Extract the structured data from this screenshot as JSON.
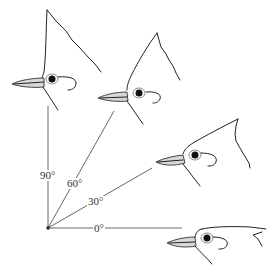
{
  "figure": {
    "type": "angle-diagram",
    "origin": {
      "x": 48,
      "y": 228
    },
    "angles": [
      {
        "label": "90°",
        "degrees": 90
      },
      {
        "label": "60°",
        "degrees": 60
      },
      {
        "label": "30°",
        "degrees": 30
      },
      {
        "label": "0°",
        "degrees": 0
      }
    ]
  }
}
